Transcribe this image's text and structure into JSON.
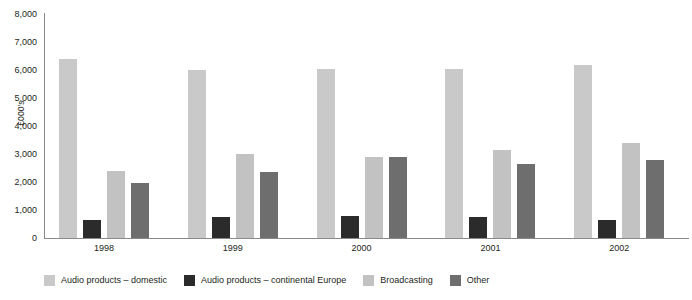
{
  "chart_data": {
    "type": "bar",
    "title": "",
    "subtitle": "",
    "xlabel": "",
    "ylabel": "£000's",
    "categories": [
      "1998",
      "1999",
      "2000",
      "2001",
      "2002"
    ],
    "series": [
      {
        "name": "Audio products – domestic",
        "color": "#c9c9c9",
        "values": [
          6400,
          6000,
          6050,
          6020,
          6180
        ]
      },
      {
        "name": "Audio products – continental Europe",
        "color": "#2b2b2b",
        "values": [
          650,
          740,
          790,
          740,
          640
        ]
      },
      {
        "name": "Broadcasting",
        "color": "#c2c2c2",
        "values": [
          2400,
          3000,
          2880,
          3150,
          3400
        ]
      },
      {
        "name": "Other",
        "color": "#6e6e6e",
        "values": [
          1950,
          2350,
          2900,
          2650,
          2790
        ]
      }
    ],
    "ylim": [
      0,
      8000
    ],
    "ytick_step": 1000,
    "ytick_labels": [
      "8,000",
      "7,000",
      "6,000",
      "5,000",
      "4,000",
      "3,000",
      "2,000",
      "1,000",
      "0"
    ],
    "grid": false,
    "legend_position": "bottom"
  },
  "legend": {
    "items": [
      {
        "label": "Audio products – domestic",
        "color": "#c9c9c9"
      },
      {
        "label": "Audio products – continental Europe",
        "color": "#2b2b2b"
      },
      {
        "label": "Broadcasting",
        "color": "#c2c2c2"
      },
      {
        "label": "Other",
        "color": "#6e6e6e"
      }
    ]
  },
  "axis": {
    "y_title": "£000's"
  }
}
